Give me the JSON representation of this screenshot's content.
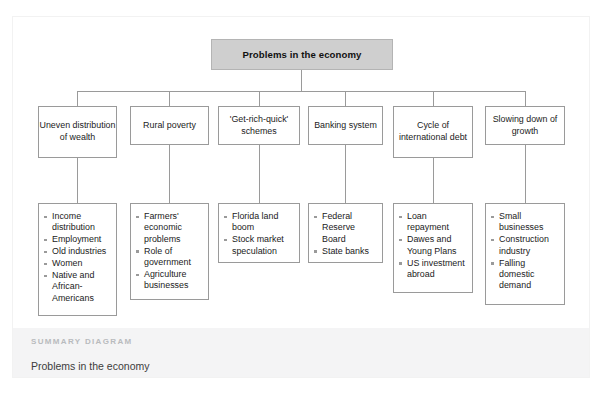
{
  "document": {
    "root": {
      "label": "Problems in the economy"
    },
    "summary": {
      "kicker": "SUMMARY DIAGRAM",
      "title": "Problems in the economy"
    },
    "colors": {
      "root_fill": "#cfcfcf",
      "box_border": "#9a9a9a",
      "band_fill": "#f4f4f5",
      "kicker_text": "#b9bbbe",
      "body_text": "#1b1b1b"
    },
    "branches": [
      {
        "title": "Uneven distribution of wealth",
        "items": [
          "Income distribution",
          "Employment",
          "Old industries",
          "Women",
          "Native and African-Americans"
        ]
      },
      {
        "title": "Rural poverty",
        "items": [
          "Farmers' economic problems",
          "Role of government",
          "Agriculture businesses"
        ]
      },
      {
        "title": "'Get-rich-quick' schemes",
        "items": [
          "Florida land boom",
          "Stock market speculation"
        ]
      },
      {
        "title": "Banking system",
        "items": [
          "Federal Reserve Board",
          "State banks"
        ]
      },
      {
        "title": "Cycle of international debt",
        "items": [
          "Loan repayment",
          "Dawes and Young Plans",
          "US investment abroad"
        ]
      },
      {
        "title": "Slowing down of growth",
        "items": [
          "Small businesses",
          "Construction industry",
          "Falling domestic demand"
        ]
      }
    ]
  }
}
